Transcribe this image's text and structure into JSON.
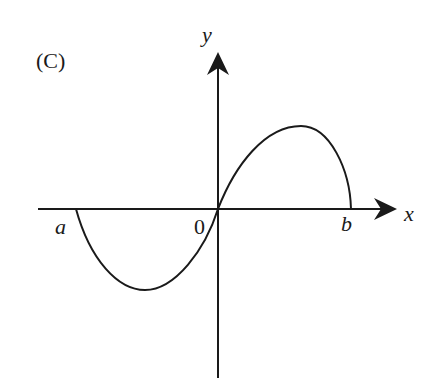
{
  "figure": {
    "label": "(C)",
    "axes": {
      "x_label": "x",
      "y_label": "y",
      "origin_label": "0",
      "left_root_label": "a",
      "right_root_label": "b"
    },
    "curve": {
      "description": "Curve starting at x=a on the axis, dipping below (minimum between a and 0), passing through origin, rising to maximum between 0 and b, ending at x=b on the axis",
      "color": "#1a1a1a"
    }
  }
}
